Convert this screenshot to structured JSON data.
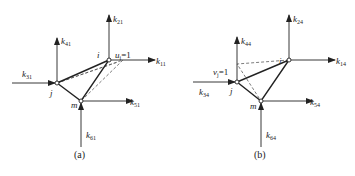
{
  "figures": [
    {
      "caption": "(a)",
      "nodes": {
        "i": "i",
        "j": "j",
        "m": "m"
      },
      "displacement": {
        "label": "u",
        "sub": "i",
        "value": "=1"
      },
      "forces": [
        {
          "k": "k",
          "sub": "11"
        },
        {
          "k": "k",
          "sub": "21"
        },
        {
          "k": "k",
          "sub": "31"
        },
        {
          "k": "k",
          "sub": "41"
        },
        {
          "k": "k",
          "sub": "51"
        },
        {
          "k": "k",
          "sub": "61"
        }
      ]
    },
    {
      "caption": "(b)",
      "nodes": {
        "i": "i",
        "j": "j",
        "m": "m"
      },
      "displacement": {
        "label": "v",
        "sub": "j",
        "value": "=1"
      },
      "forces": [
        {
          "k": "k",
          "sub": "14"
        },
        {
          "k": "k",
          "sub": "24"
        },
        {
          "k": "k",
          "sub": "34"
        },
        {
          "k": "k",
          "sub": "44"
        },
        {
          "k": "k",
          "sub": "54"
        },
        {
          "k": "k",
          "sub": "64"
        }
      ]
    }
  ],
  "colors": {
    "line": "#222222",
    "background": "#ffffff"
  }
}
